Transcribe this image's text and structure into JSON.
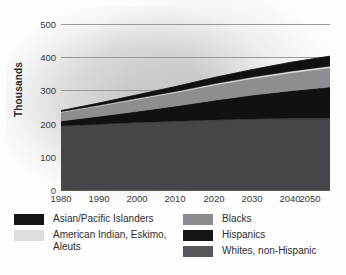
{
  "chart_data": {
    "type": "area",
    "title": "",
    "subtitle": "",
    "xlabel": "",
    "ylabel": "Thousands",
    "stacked": true,
    "grid": true,
    "legend_position": "bottom",
    "x": [
      1980,
      1990,
      2000,
      2010,
      2020,
      2030,
      2040,
      2050
    ],
    "categories": [
      "1980",
      "1990",
      "2000",
      "2010",
      "2020",
      "2030",
      "2040",
      "2050"
    ],
    "xlim": [
      1980,
      2050
    ],
    "ylim": [
      0,
      500
    ],
    "yticks": [
      0,
      100,
      200,
      300,
      400,
      500
    ],
    "xticks": [
      "1980",
      "1990",
      "2000",
      "2010",
      "2020",
      "2030",
      "2040",
      "2050"
    ],
    "series": [
      {
        "name": "Whites, non-Hispanic",
        "color": "#46464a",
        "values": [
          193,
          198,
          203,
          207,
          211,
          214,
          215,
          215
        ]
      },
      {
        "name": "Hispanics",
        "color": "#111113",
        "values": [
          15,
          24,
          34,
          46,
          59,
          72,
          84,
          95
        ]
      },
      {
        "name": "Blacks",
        "color": "#8d8d92",
        "values": [
          26,
          31,
          36,
          41,
          46,
          50,
          54,
          58
        ]
      },
      {
        "name": "American Indian, Eskimo, Aleuts",
        "color": "#dcdcdc",
        "values": [
          2,
          2,
          3,
          3,
          4,
          4,
          5,
          5
        ]
      },
      {
        "name": "Asian/Pacific Islanders",
        "color": "#111113",
        "values": [
          3,
          7,
          11,
          15,
          19,
          23,
          27,
          30
        ]
      }
    ],
    "totals": [
      239,
      262,
      287,
      312,
      339,
      363,
      385,
      403
    ],
    "annotations": []
  },
  "axis": {
    "y_title": "Thousands",
    "y_ticks": [
      "500",
      "400",
      "300",
      "200",
      "100",
      "0"
    ],
    "x_ticks": [
      "1980",
      "1990",
      "2000",
      "2010",
      "2020",
      "2030",
      "2040",
      "2050"
    ]
  },
  "legend": {
    "left": [
      {
        "label": "Asian/Pacific Islanders",
        "color": "#141416"
      },
      {
        "label": "American Indian, Eskimo, Aleuts",
        "color": "#dedede"
      }
    ],
    "right": [
      {
        "label": "Blacks",
        "color": "#8a8a8f"
      },
      {
        "label": "Hispanics",
        "color": "#141416"
      },
      {
        "label": "Whites, non-Hispanic",
        "color": "#57575b"
      }
    ]
  }
}
